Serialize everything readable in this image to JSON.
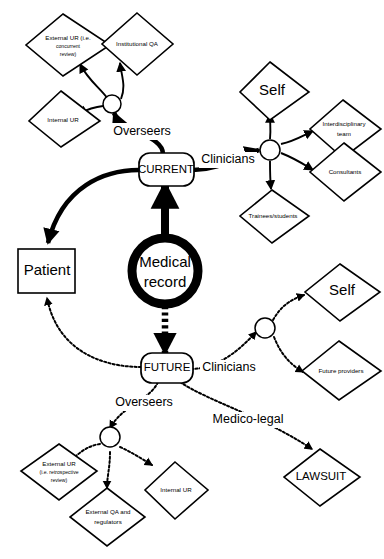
{
  "diagram": {
    "center": {
      "label": "Medical record"
    },
    "states": {
      "current": "CURRENT",
      "future": "FUTURE"
    },
    "edge_labels": {
      "overseers_top": "Overseers",
      "clinicians_top": "Clinicians",
      "overseers_bottom": "Overseers",
      "clinicians_bottom": "Clinicians",
      "medico_legal": "Medico-legal"
    },
    "nodes": {
      "patient": "Patient",
      "external_ur_concurrent": [
        "External UR (i.e.",
        "concurrent",
        "review)"
      ],
      "institutional_qa": "Institutional QA",
      "internal_ur_top": "Internal UR",
      "self_top": "Self",
      "interdisciplinary_team": [
        "Interdisciplinary",
        "team"
      ],
      "consultants": "Consultants",
      "trainees_students": "Trainees/students",
      "self_bottom": "Self",
      "future_providers": "Future providers",
      "external_ur_retrospective": [
        "External UR",
        "(i.e. retrospective",
        "review)"
      ],
      "external_qa_regulators": [
        "External QA and",
        "regulators"
      ],
      "internal_ur_bottom": "Internal UR",
      "lawsuit": "LAWSUIT"
    },
    "colors": {
      "stroke": "#000000",
      "fill": "#ffffff",
      "background": "#ffffff"
    }
  }
}
